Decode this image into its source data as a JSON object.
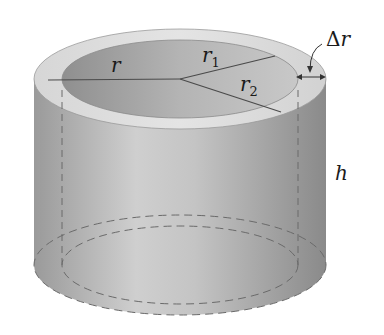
{
  "diagram": {
    "labels": {
      "r": "r",
      "r1_base": "r",
      "r1_sub": "1",
      "r2_base": "r",
      "r2_sub": "2",
      "delta_symbol": "Δ",
      "delta_var": "r",
      "height": "h"
    },
    "colors": {
      "outer_wall_light": "#d0d0d0",
      "outer_wall_dark": "#8e8e8e",
      "rim": "#dcdcdc",
      "inner_hole": "#a8a8a8",
      "lines": "#4a4a4a",
      "dashed": "#6a6a6a",
      "background": "#ffffff"
    }
  }
}
